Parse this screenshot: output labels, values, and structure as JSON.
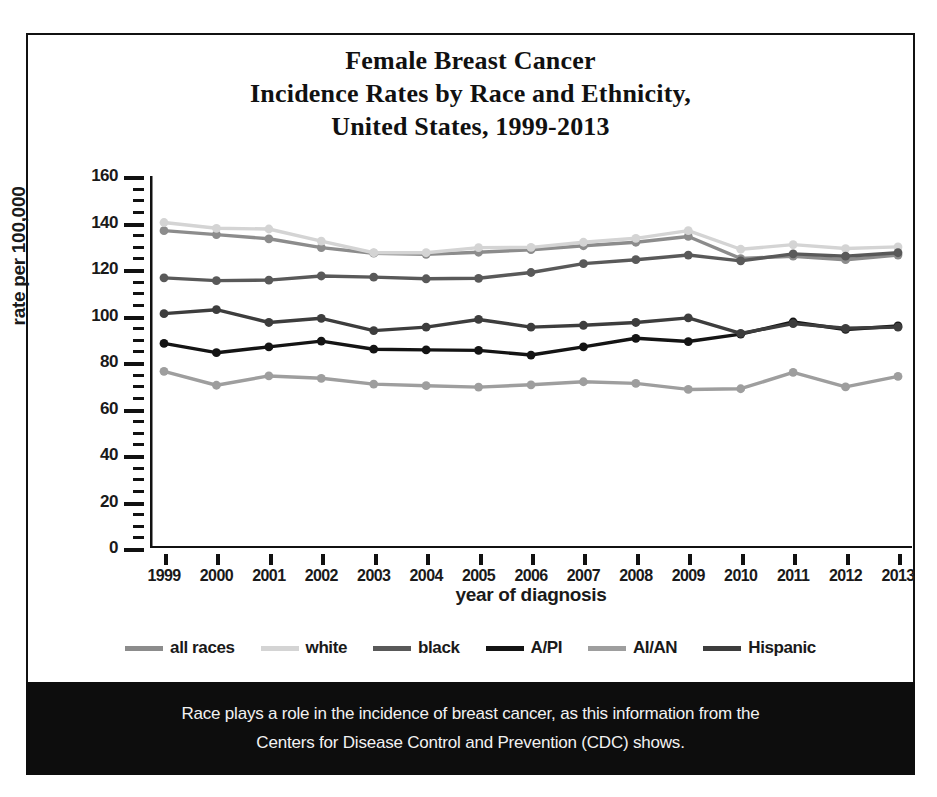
{
  "title": {
    "line1": "Female Breast Cancer",
    "line2": "Incidence Rates by Race and Ethnicity,",
    "line3": "United States, 1999-2013"
  },
  "caption": {
    "line1": "Race plays a role in the incidence of breast cancer, as this information from the",
    "line2": "Centers for Disease Control and Prevention (CDC) shows."
  },
  "chart_data": {
    "type": "line",
    "title": "Female Breast Cancer Incidence Rates by Race and Ethnicity, United States, 1999-2013",
    "xlabel": "year of diagnosis",
    "ylabel": "rate per 100,000",
    "ylim": [
      0,
      160
    ],
    "ytick_step": 20,
    "yminor_step": 5,
    "grid": false,
    "legend_position": "bottom",
    "categories": [
      "1999",
      "2000",
      "2001",
      "2002",
      "2003",
      "2004",
      "2005",
      "2006",
      "2007",
      "2008",
      "2009",
      "2010",
      "2011",
      "2012",
      "2013"
    ],
    "x": [
      1999,
      2000,
      2001,
      2002,
      2003,
      2004,
      2005,
      2006,
      2007,
      2008,
      2009,
      2010,
      2011,
      2012,
      2013
    ],
    "yticks": [
      0,
      20,
      40,
      60,
      80,
      100,
      120,
      140,
      160
    ],
    "series": [
      {
        "name": "all races",
        "color": "#8c8c8c",
        "values": [
          136.5,
          134.8,
          133.0,
          129.2,
          126.8,
          126.3,
          127.2,
          128.3,
          130.0,
          131.5,
          134.0,
          124.5,
          125.5,
          124.0,
          126.0
        ]
      },
      {
        "name": "white",
        "color": "#d4d4d4",
        "values": [
          140.0,
          137.5,
          137.2,
          132.0,
          127.0,
          127.0,
          129.2,
          129.3,
          131.5,
          133.2,
          136.5,
          128.5,
          130.5,
          128.8,
          129.5
        ]
      },
      {
        "name": "black",
        "color": "#595959",
        "values": [
          116.2,
          115.0,
          115.2,
          117.0,
          116.5,
          115.8,
          116.0,
          118.5,
          122.3,
          124.0,
          126.0,
          123.5,
          126.5,
          125.5,
          127.0
        ]
      },
      {
        "name": "A/PI",
        "color": "#141414",
        "values": [
          88.0,
          84.0,
          86.5,
          89.0,
          85.5,
          85.2,
          85.0,
          83.0,
          86.5,
          90.2,
          88.8,
          92.0,
          97.2,
          94.0,
          95.5
        ]
      },
      {
        "name": "AI/AN",
        "color": "#9e9e9e",
        "values": [
          76.0,
          70.0,
          74.0,
          73.0,
          70.5,
          69.8,
          69.2,
          70.2,
          71.5,
          70.8,
          68.2,
          68.5,
          75.5,
          69.3,
          73.8
        ]
      },
      {
        "name": "Hispanic",
        "color": "#3d3d3d",
        "values": [
          100.8,
          102.5,
          97.0,
          98.8,
          93.5,
          95.0,
          98.3,
          95.0,
          95.8,
          97.0,
          99.0,
          92.3,
          96.5,
          94.5,
          95.0
        ]
      }
    ]
  }
}
